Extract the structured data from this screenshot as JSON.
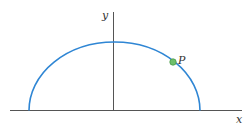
{
  "diagram": {
    "type": "semi-ellipse on coordinate axes",
    "axes": {
      "x_label": "x",
      "y_label": "y",
      "color": "#555555"
    },
    "curve": {
      "shape": "upper half of ellipse",
      "color": "#2f86d4"
    },
    "point": {
      "label": "P",
      "fill": "#6fbf6a",
      "stroke": "#4a9a48"
    }
  }
}
